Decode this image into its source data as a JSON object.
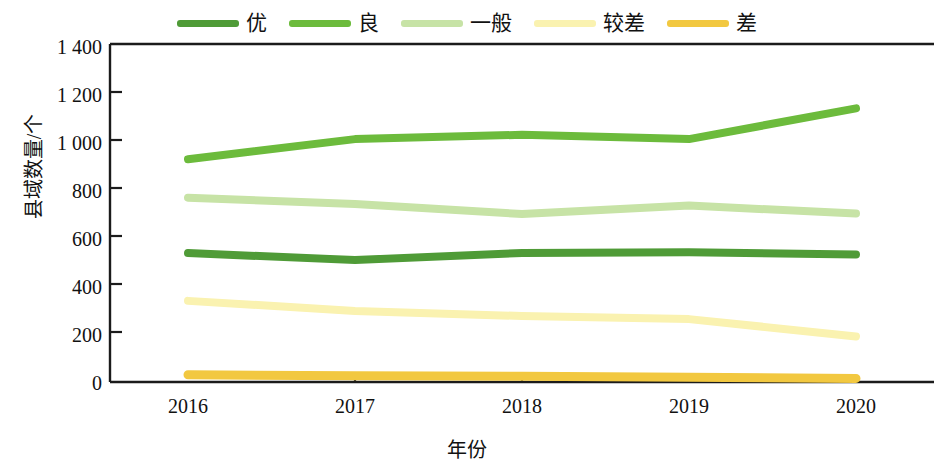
{
  "chart_data": {
    "type": "line",
    "title": "",
    "xlabel": "年份",
    "ylabel": "县域数量/个",
    "categories": [
      "2016",
      "2017",
      "2018",
      "2019",
      "2020"
    ],
    "x": [
      2016,
      2017,
      2018,
      2019,
      2020
    ],
    "ylim": [
      0,
      1400
    ],
    "yticks": [
      0,
      200,
      400,
      600,
      800,
      1000,
      1200,
      1400
    ],
    "ytick_labels": [
      "0",
      "200",
      "400",
      "600",
      "800",
      "1 000",
      "1 200",
      "1 400"
    ],
    "grid": false,
    "legend_position": "top-center",
    "series": [
      {
        "name": "优",
        "color": "#4f9b37",
        "values": [
          537,
          508,
          538,
          541,
          531
        ]
      },
      {
        "name": "良",
        "color": "#6cbb3c",
        "values": [
          928,
          1012,
          1030,
          1012,
          1140
        ]
      },
      {
        "name": "一般",
        "color": "#c7e3a6",
        "values": [
          768,
          742,
          700,
          735,
          702
        ]
      },
      {
        "name": "较差",
        "color": "#faf2b0",
        "values": [
          338,
          296,
          275,
          262,
          190
        ]
      },
      {
        "name": "差",
        "color": "#f2c840",
        "values": [
          30,
          26,
          24,
          20,
          15
        ]
      }
    ]
  },
  "legend": {
    "items": [
      {
        "label": "优",
        "color": "#4f9b37"
      },
      {
        "label": "良",
        "color": "#6cbb3c"
      },
      {
        "label": "一般",
        "color": "#c7e3a6"
      },
      {
        "label": "较差",
        "color": "#faf2b0"
      },
      {
        "label": "差",
        "color": "#f2c840"
      }
    ]
  },
  "axes": {
    "y_title": "县域数量/个",
    "x_title": "年份",
    "y_tick_labels": [
      "1 400",
      "1 200",
      "1 000",
      "800",
      "600",
      "400",
      "200",
      "0"
    ],
    "x_tick_labels": [
      "2016",
      "2017",
      "2018",
      "2019",
      "2020"
    ]
  }
}
